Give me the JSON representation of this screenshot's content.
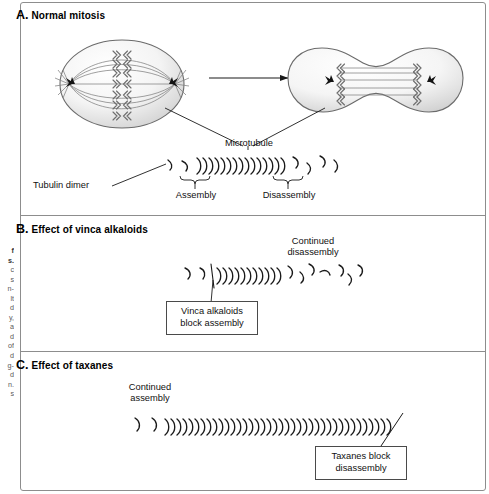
{
  "figure": {
    "panels": [
      {
        "id": "A",
        "letter": "A.",
        "title": "Normal mitosis",
        "labels": {
          "microtubule": "Microtubule",
          "tubulin_dimer": "Tubulin dimer",
          "assembly": "Assembly",
          "disassembly": "Disassembly"
        },
        "cells": [
          {
            "name": "metaphase-cell",
            "stage": "metaphase",
            "shape": "ellipse",
            "chromosome_pairs": 7,
            "spindle_fibers": 7,
            "centrosomes": 2
          },
          {
            "name": "anaphase-cell",
            "stage": "anaphase",
            "shape": "dumbbell",
            "chromosome_pairs": 5,
            "spindle_fibers": 5,
            "centrosomes": 2
          }
        ],
        "transition_arrow": "progression-arrow"
      },
      {
        "id": "B",
        "letter": "B.",
        "title": "Effect of vinca alkaloids",
        "labels": {
          "continued_disassembly_line1": "Continued",
          "continued_disassembly_line2": "disassembly"
        },
        "callout": {
          "line1": "Vinca alkaloids",
          "line2": "block assembly"
        },
        "microtubule_subunits": 11,
        "free_dimers_left": 2,
        "free_dimers_right": 7
      },
      {
        "id": "C",
        "letter": "C.",
        "title": "Effect of taxanes",
        "labels": {
          "continued_assembly_line1": "Continued",
          "continued_assembly_line2": "assembly"
        },
        "callout": {
          "line1": "Taxanes block",
          "line2": "disassembly"
        },
        "microtubule_subunits": 38,
        "free_dimers_left": 2
      }
    ],
    "caption_fragments": [
      "f",
      "s.",
      "c",
      "s",
      "n-",
      "lt",
      "d",
      "y,",
      "a",
      "d",
      "of",
      "d",
      "g-",
      "d",
      "n.",
      "s"
    ],
    "colors": {
      "frame_border": "#8d8d8d",
      "cell_fill_light": "#fdfdfd",
      "cell_fill_shade": "#d4d4d4",
      "cell_outline": "#6b6b6b",
      "spindle": "#7b7b7b",
      "chromosome": "#6e6e6e",
      "centrosome": "#141414",
      "ink": "#1a1a1a",
      "callout_border": "#4a4a4a"
    }
  }
}
